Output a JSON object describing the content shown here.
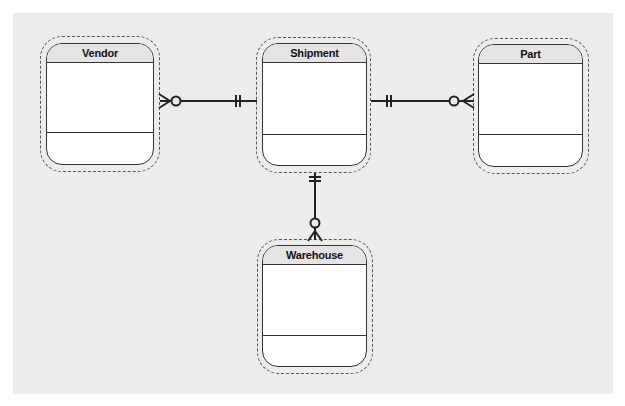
{
  "diagram": {
    "type": "entity-relationship",
    "notation": "crows-foot",
    "canvas_color": "#ececec",
    "entities": [
      {
        "id": "vendor",
        "label": "Vendor"
      },
      {
        "id": "shipment",
        "label": "Shipment"
      },
      {
        "id": "part",
        "label": "Part"
      },
      {
        "id": "warehouse",
        "label": "Warehouse"
      }
    ],
    "relationships": [
      {
        "from": "shipment",
        "to": "vendor",
        "from_cardinality": "one-and-only-one",
        "to_cardinality": "zero-or-many"
      },
      {
        "from": "shipment",
        "to": "part",
        "from_cardinality": "one-and-only-one",
        "to_cardinality": "zero-or-many"
      },
      {
        "from": "shipment",
        "to": "warehouse",
        "from_cardinality": "one-and-only-one",
        "to_cardinality": "zero-or-many"
      }
    ]
  }
}
